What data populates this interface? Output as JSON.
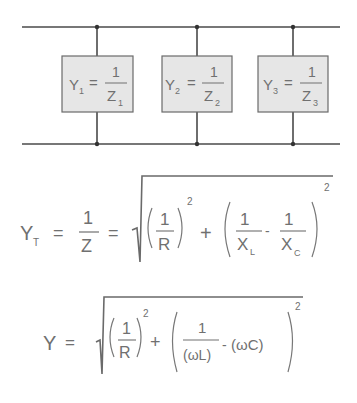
{
  "circuit": {
    "branches": [
      {
        "admittance": "Y",
        "sub": "1",
        "eq": "=",
        "numerator": "1",
        "impedance": "Z",
        "imp_sub": "1"
      },
      {
        "admittance": "Y",
        "sub": "2",
        "eq": "=",
        "numerator": "1",
        "impedance": "Z",
        "imp_sub": "2"
      },
      {
        "admittance": "Y",
        "sub": "3",
        "eq": "=",
        "numerator": "1",
        "impedance": "Z",
        "imp_sub": "3"
      }
    ],
    "colors": {
      "wire": "#4a4a4a",
      "box_fill": "#e6e6e6",
      "box_border": "#6a6a6a",
      "text": "#707070"
    }
  },
  "formula_total": {
    "lhs": "Y",
    "lhs_sub": "T",
    "eq1": "=",
    "frac_num": "1",
    "frac_den": "Z",
    "eq2": "=",
    "term1_num": "1",
    "term1_den": "R",
    "term1_exp": "2",
    "plus": "+",
    "term2a_num": "1",
    "term2a_den": "X",
    "term2a_den_sub": "L",
    "minus": "-",
    "term2b_num": "1",
    "term2b_den": "X",
    "term2b_den_sub": "C",
    "term2_exp": "2"
  },
  "formula_omega": {
    "lhs": "Y",
    "eq": "=",
    "term1_num": "1",
    "term1_den": "R",
    "term1_exp": "2",
    "plus": "+",
    "term2a_num": "1",
    "term2a_den": "(ωL)",
    "minus": "-",
    "term2b": "(ωC)",
    "term2_exp": "2"
  }
}
